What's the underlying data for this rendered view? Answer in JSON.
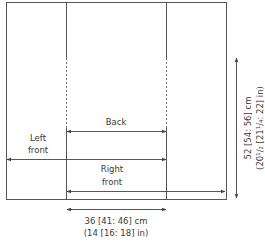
{
  "diagram": {
    "type": "knitting-schematic",
    "pieces": {
      "back": "Back",
      "left_front": [
        "Left",
        "front"
      ],
      "right_front": [
        "Right",
        "front"
      ]
    },
    "dimensions": {
      "width": {
        "cm": "36 [41: 46] cm",
        "in": "(14 [16: 18] in)"
      },
      "length": {
        "cm": "52 [54: 56] cm",
        "in": "(20¹/₂ [21¹/₄: 22] in)"
      }
    },
    "colors": {
      "line": "#555555",
      "text": "#3a3a3a"
    }
  }
}
